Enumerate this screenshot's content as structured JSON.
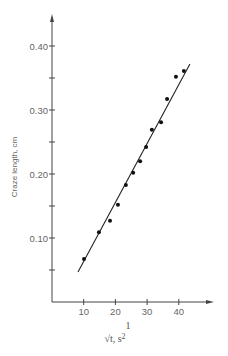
{
  "chart_data": {
    "type": "scatter",
    "title": "",
    "xlabel": "√t, s^(1/2)",
    "xlabel_main": "√t, s",
    "xlabel_sup": "2",
    "xlabel_sup_top": "1",
    "ylabel": "Craze length, cm",
    "xlim": [
      0,
      50
    ],
    "ylim": [
      0,
      0.45
    ],
    "x_ticks": [
      10,
      20,
      30,
      40
    ],
    "x_tick_labels": [
      "10",
      "20",
      "30",
      "40"
    ],
    "y_ticks": [
      0.05,
      0.1,
      0.15,
      0.2,
      0.25,
      0.3,
      0.35,
      0.4
    ],
    "y_tick_labels": [
      "0.10",
      "0.20",
      "0.30",
      "0.40"
    ],
    "grid": false,
    "legend": null,
    "series": [
      {
        "name": "measured",
        "marker": "filled-circle",
        "x": [
          10.1,
          14.8,
          18.3,
          20.8,
          23.3,
          25.6,
          27.8,
          29.7,
          31.5,
          34.4,
          36.3,
          39.1,
          41.6
        ],
        "y": [
          0.067,
          0.109,
          0.127,
          0.152,
          0.183,
          0.202,
          0.22,
          0.242,
          0.269,
          0.281,
          0.317,
          0.352,
          0.361
        ]
      },
      {
        "name": "linear fit",
        "type": "line",
        "x": [
          8.2,
          43.5
        ],
        "y": [
          0.047,
          0.372
        ]
      }
    ]
  },
  "colors": {
    "ink": "#222222",
    "axis": "#444444",
    "text": "#666666"
  }
}
